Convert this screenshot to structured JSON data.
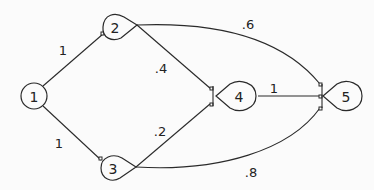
{
  "diagram": {
    "type": "directed-network",
    "nodes": [
      {
        "id": "1",
        "label": "1"
      },
      {
        "id": "2",
        "label": "2"
      },
      {
        "id": "3",
        "label": "3"
      },
      {
        "id": "4",
        "label": "4"
      },
      {
        "id": "5",
        "label": "5"
      }
    ],
    "edges": [
      {
        "from": "1",
        "to": "2",
        "label": "1"
      },
      {
        "from": "1",
        "to": "3",
        "label": "1"
      },
      {
        "from": "2",
        "to": "4",
        "label": ".4"
      },
      {
        "from": "2",
        "to": "5",
        "label": ".6"
      },
      {
        "from": "3",
        "to": "4",
        "label": ".2"
      },
      {
        "from": "3",
        "to": "5",
        "label": ".8"
      },
      {
        "from": "4",
        "to": "5",
        "label": "1"
      }
    ]
  }
}
